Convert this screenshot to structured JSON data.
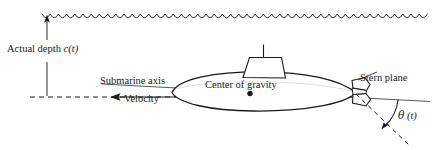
{
  "figure": {
    "width": 441,
    "height": 150,
    "background_color": "#ffffff",
    "stroke_color": "#1a1a1a"
  },
  "labels": {
    "actual_depth": "Actual depth ",
    "actual_depth_var": "c(t)",
    "submarine_axis": "Submarine axis",
    "velocity": "Velocity",
    "center_of_gravity": "Center of gravity",
    "stern_plane": "Stern plane",
    "theta_symbol": "θ",
    "theta_arg": " (t)"
  },
  "elements": {
    "water_surface": "wavy-water-surface-line",
    "depth_arrow": "vertical-depth-arrow-up",
    "reference_line": "horizontal-dashed-reference-line",
    "velocity_arrow": "leftward-velocity-arrow",
    "hull": "submarine-hull-ellipse",
    "conning_tower": "conning-tower-trapezoid",
    "periscope": "periscope-mast",
    "cg_marker": "center-of-gravity-dot",
    "stern_plane_fin": "stern-plane-fin",
    "axis_line": "submarine-axis-line",
    "dashed_pitch_line": "dashed-pitch-reference-line",
    "theta_arc": "theta-angle-arc-arrow",
    "stern_leader": "stern-plane-leader-line"
  },
  "geometry": {
    "water_surface_y": 14,
    "reference_line_y": 97,
    "axis_angle_deg": 6.5,
    "theta_angle_deg": 47
  }
}
